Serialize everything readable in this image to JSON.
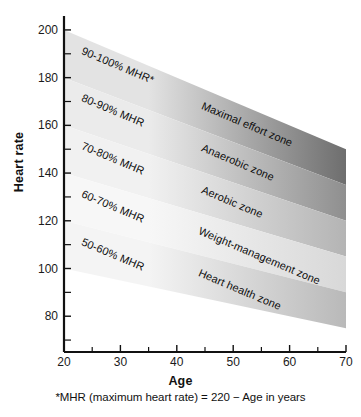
{
  "chart_data": {
    "type": "area",
    "title": "",
    "xlabel": "Age",
    "ylabel": "Heart rate",
    "xlim": [
      20,
      70
    ],
    "ylim": [
      65,
      205
    ],
    "grid": false,
    "legend_position": "inline-band-labels",
    "x_ticks_major": [
      20,
      30,
      40,
      50,
      60,
      70
    ],
    "x_ticks_minor": [
      25,
      35,
      45,
      55,
      65
    ],
    "y_ticks_major": [
      200,
      180,
      160,
      140,
      120,
      100,
      80
    ],
    "y_ticks_minor": [
      190,
      170,
      150,
      130,
      110,
      90,
      70
    ],
    "footnote": "*MHR (maximum heart rate) = 220 − Age in years",
    "formula": {
      "mhr_at_age": "220 - age",
      "band_lower_fraction_of_mhr": "pct_low/100",
      "band_upper_fraction_of_mhr": "pct_high/100"
    },
    "series": [
      {
        "name": "90-100% MHR",
        "zone_name": "Maximal effort zone",
        "percent_low": 90,
        "percent_high": 100,
        "x": [
          20,
          70
        ],
        "y_upper": [
          200,
          150
        ],
        "y_lower": [
          180,
          135
        ],
        "color_left": "#e3e3e3",
        "color_right": "#6e6e6e"
      },
      {
        "name": "80-90% MHR",
        "zone_name": "Anaerobic zone",
        "percent_low": 80,
        "percent_high": 90,
        "x": [
          20,
          70
        ],
        "y_upper": [
          180,
          135
        ],
        "y_lower": [
          160,
          120
        ],
        "color_left": "#ebebeb",
        "color_right": "#8f8f8f"
      },
      {
        "name": "70-80% MHR",
        "zone_name": "Aerobic zone",
        "percent_low": 70,
        "percent_high": 80,
        "x": [
          20,
          70
        ],
        "y_upper": [
          160,
          120
        ],
        "y_lower": [
          140,
          105
        ],
        "color_left": "#f1f1f1",
        "color_right": "#b4b4b4"
      },
      {
        "name": "60-70% MHR",
        "zone_name": "Weight-management zone",
        "percent_low": 60,
        "percent_high": 70,
        "x": [
          20,
          70
        ],
        "y_upper": [
          140,
          105
        ],
        "y_lower": [
          120,
          90
        ],
        "color_left": "#f7f7f7",
        "color_right": "#d8d8d8"
      },
      {
        "name": "50-60% MHR",
        "zone_name": "Heart health zone",
        "percent_low": 50,
        "percent_high": 60,
        "x": [
          20,
          70
        ],
        "y_upper": [
          120,
          90
        ],
        "y_lower": [
          100,
          75
        ],
        "color_left": "#f4f4f4",
        "color_right": "#b9b9b9"
      }
    ]
  },
  "axis": {
    "y_title": "Heart rate",
    "x_title": "Age",
    "y_labels": [
      "200",
      "180",
      "160",
      "140",
      "120",
      "100",
      "80"
    ],
    "x_labels": [
      "20",
      "30",
      "40",
      "50",
      "60",
      "70"
    ],
    "line_color": "#111111"
  },
  "band_labels_left": [
    {
      "text": "90-100% MHR*"
    },
    {
      "text": "80-90% MHR"
    },
    {
      "text": "70-80% MHR"
    },
    {
      "text": "60-70% MHR"
    },
    {
      "text": "50-60% MHR"
    }
  ],
  "band_labels_right": [
    {
      "text": "Maximal effort zone"
    },
    {
      "text": "Anaerobic zone"
    },
    {
      "text": "Aerobic zone"
    },
    {
      "text": "Weight-management zone"
    },
    {
      "text": "Heart health zone"
    }
  ],
  "footnote": {
    "text": "*MHR (maximum heart rate) = 220 − Age in years"
  }
}
